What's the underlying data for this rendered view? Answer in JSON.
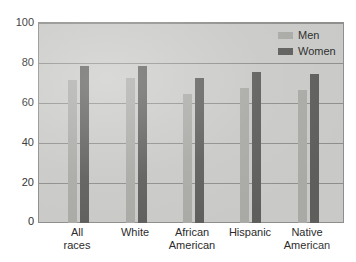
{
  "chart_data": {
    "type": "bar",
    "title": "",
    "xlabel": "",
    "ylabel": "",
    "ylim": [
      0,
      100
    ],
    "yticks": [
      0,
      20,
      40,
      60,
      80,
      100
    ],
    "grid": true,
    "legend_position": "top-right",
    "categories": [
      "All races",
      "White",
      "African American",
      "Hispanic",
      "Native American"
    ],
    "category_lines": [
      [
        "All",
        "races"
      ],
      [
        "White",
        ""
      ],
      [
        "African",
        "American"
      ],
      [
        "Hispanic",
        ""
      ],
      [
        "Native",
        "American"
      ]
    ],
    "series": [
      {
        "name": "Men",
        "color": "#a9a9a6",
        "values": [
          72,
          73,
          65,
          68,
          67
        ]
      },
      {
        "name": "Women",
        "color": "#5e5e5c",
        "values": [
          79,
          79,
          73,
          76,
          75
        ]
      }
    ]
  },
  "legend": {
    "items": [
      {
        "label": "Men",
        "swatch": "men"
      },
      {
        "label": "Women",
        "swatch": "women"
      }
    ]
  },
  "colors": {
    "plot_background": "#c9c9c7",
    "gridline": "#8e8e8c",
    "men_bar": "#a9a9a6",
    "women_bar": "#5e5e5c",
    "text": "#2b2b2b",
    "page_background": "#ffffff"
  }
}
